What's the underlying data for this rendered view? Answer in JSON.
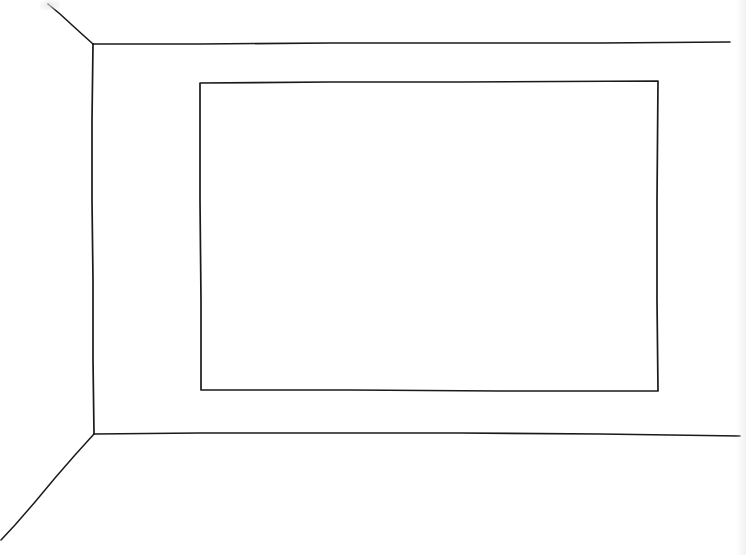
{
  "drawing": {
    "subject": "Hand-drawn perspective sketch of a room corner with a rectangular frame on the back wall",
    "style": "line-art",
    "ink_color": "#1a1a1a",
    "paper_color": "#ffffff",
    "elements": [
      {
        "id": "ceiling-diagonal",
        "description": "ceiling edge receding toward top-left corner"
      },
      {
        "id": "ceiling-line",
        "description": "ceiling line along back wall"
      },
      {
        "id": "left-wall-corner",
        "description": "vertical corner between left wall and back wall"
      },
      {
        "id": "floor-line",
        "description": "floor line along back wall"
      },
      {
        "id": "floor-diagonal",
        "description": "floor edge receding toward bottom-left corner"
      },
      {
        "id": "wall-frame",
        "description": "rectangle drawn on back wall (picture frame / window)"
      }
    ]
  }
}
